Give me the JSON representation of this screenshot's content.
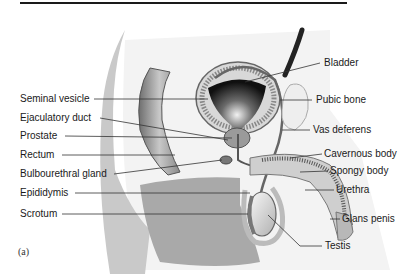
{
  "figure": {
    "panel_label": "(a)",
    "labels_left": [
      {
        "text": "Seminal vesicle",
        "x": 20,
        "y": 93
      },
      {
        "text": "Ejaculatory duct",
        "x": 20,
        "y": 112
      },
      {
        "text": "Prostate",
        "x": 20,
        "y": 130
      },
      {
        "text": "Rectum",
        "x": 20,
        "y": 149
      },
      {
        "text": "Bulbourethral gland",
        "x": 20,
        "y": 168
      },
      {
        "text": "Epididymis",
        "x": 20,
        "y": 187
      },
      {
        "text": "Scrotum",
        "x": 20,
        "y": 208
      }
    ],
    "labels_right": [
      {
        "text": "Bladder",
        "x": 324,
        "y": 57
      },
      {
        "text": "Pubic bone",
        "x": 316,
        "y": 94
      },
      {
        "text": "Vas deferens",
        "x": 313,
        "y": 124
      },
      {
        "text": "Cavernous body",
        "x": 324,
        "y": 148
      },
      {
        "text": "Spongy body",
        "x": 330,
        "y": 165
      },
      {
        "text": "Urethra",
        "x": 336,
        "y": 184
      },
      {
        "text": "Glans penis",
        "x": 342,
        "y": 213
      },
      {
        "text": "Testis",
        "x": 325,
        "y": 240
      }
    ]
  }
}
